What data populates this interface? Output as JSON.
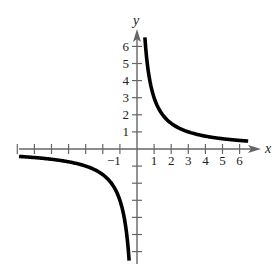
{
  "chart_data": {
    "type": "line",
    "title": "",
    "xlabel": "x",
    "ylabel": "y",
    "function": "y = 3/x",
    "xlim": [
      -7,
      6.5
    ],
    "ylim": [
      -7,
      6.5
    ],
    "grid": false,
    "legend": null,
    "x_tick_labels": [
      "-1",
      "1",
      "2",
      "3",
      "4",
      "5",
      "6"
    ],
    "y_tick_labels": [
      "1",
      "2",
      "3",
      "4",
      "5",
      "6"
    ],
    "x_ticks": [
      -7,
      -6,
      -5,
      -4,
      -3,
      -2,
      -1,
      1,
      2,
      3,
      4,
      5,
      6
    ],
    "y_ticks": [
      -6,
      -5,
      -4,
      -3,
      -2,
      -1,
      1,
      2,
      3,
      4,
      5,
      6
    ],
    "series": [
      {
        "name": "right-branch",
        "x": [
          0.46,
          0.5,
          0.6,
          0.75,
          1,
          1.5,
          2,
          3,
          4,
          5,
          6,
          6.5
        ],
        "y": [
          6.52,
          6,
          5,
          4,
          3,
          2,
          1.5,
          1,
          0.75,
          0.6,
          0.5,
          0.46
        ]
      },
      {
        "name": "left-branch",
        "x": [
          -7,
          -6,
          -5,
          -4,
          -3,
          -2,
          -1.5,
          -1,
          -0.75,
          -0.6,
          -0.5,
          -0.46
        ],
        "y": [
          -0.43,
          -0.5,
          -0.6,
          -0.75,
          -1,
          -1.5,
          -2,
          -3,
          -4,
          -5,
          -6,
          -6.52
        ]
      }
    ],
    "colors": {
      "axis": "#666666",
      "curve": "#000000",
      "text": "#222222"
    }
  }
}
